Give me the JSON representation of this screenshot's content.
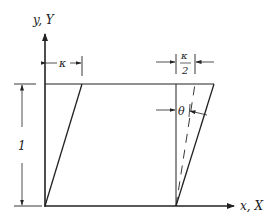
{
  "diagram": {
    "type": "shear-deformation",
    "axes": {
      "vertical_label": "y, Y",
      "horizontal_label": "x, X"
    },
    "dimensions": {
      "shear_offset_label": "κ",
      "half_offset_numerator": "κ",
      "half_offset_denominator": "2",
      "height_label": "1",
      "angle_label": "θ"
    },
    "colors": {
      "line": "#222222",
      "background": "#ffffff"
    }
  }
}
